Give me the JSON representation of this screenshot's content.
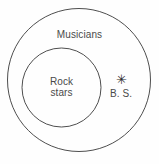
{
  "diagram": {
    "type": "nested-set-venn",
    "background_color": "#fefefe",
    "stroke_color": "#3a3a3a",
    "text_color": "#4a4a4a",
    "outer_set": {
      "label": "Musicians",
      "cx": 79,
      "cy": 80,
      "r": 72
    },
    "inner_set": {
      "label_line1": "Rock",
      "label_line2": "stars",
      "cx": 61.5,
      "cy": 87.5,
      "r": 39.5
    },
    "point": {
      "marker": "asterisk-marker",
      "glyph": "✳",
      "label": "B. S.",
      "x": 120,
      "y": 79
    }
  }
}
